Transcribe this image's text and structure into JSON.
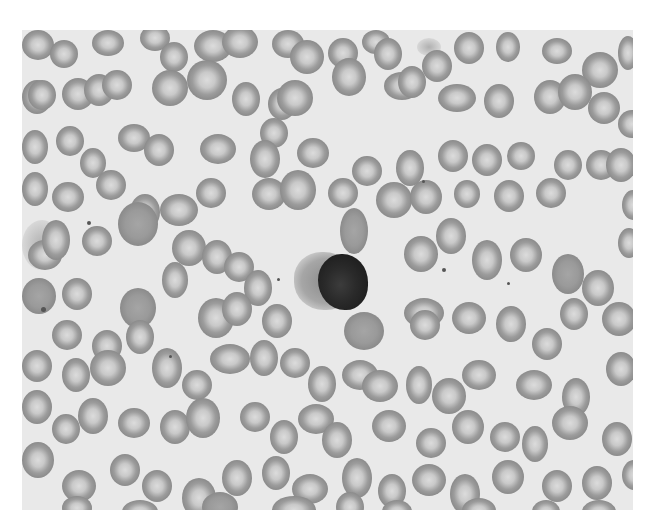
{
  "image": {
    "subject": "blood smear micrograph",
    "colors": {
      "background": "#ffffff",
      "field": "#e9e9e9",
      "rbc_rim": "#8a8a8a",
      "rbc_center": "#dcdcdc",
      "nucleus": "#222222"
    },
    "frame": {
      "x": 22,
      "y": 30,
      "w": 611,
      "h": 480
    },
    "lymphocyte": {
      "cytoplasm": {
        "x": 272,
        "y": 222,
        "w": 62,
        "h": 58
      },
      "nucleus": {
        "x": 296,
        "y": 224,
        "w": 50,
        "h": 56
      }
    },
    "platelets": [
      {
        "x": 400,
        "y": 150,
        "s": 3
      },
      {
        "x": 420,
        "y": 238,
        "s": 4
      },
      {
        "x": 485,
        "y": 252,
        "s": 3
      },
      {
        "x": 255,
        "y": 248,
        "s": 3
      },
      {
        "x": 65,
        "y": 191,
        "s": 4
      },
      {
        "x": 147,
        "y": 325,
        "s": 3
      },
      {
        "x": 19,
        "y": 277,
        "s": 5
      }
    ],
    "smudges": [
      {
        "x": 0,
        "y": 190,
        "w": 40,
        "h": 50
      },
      {
        "x": 395,
        "y": 8,
        "w": 24,
        "h": 18
      }
    ],
    "cells": [
      {
        "x": 0,
        "y": 0,
        "w": 32,
        "h": 30
      },
      {
        "x": 28,
        "y": 10,
        "w": 28,
        "h": 28
      },
      {
        "x": 70,
        "y": 0,
        "w": 32,
        "h": 26
      },
      {
        "x": 118,
        "y": -5,
        "w": 30,
        "h": 26
      },
      {
        "x": 138,
        "y": 12,
        "w": 28,
        "h": 30
      },
      {
        "x": 172,
        "y": 0,
        "w": 38,
        "h": 32
      },
      {
        "x": 200,
        "y": -4,
        "w": 36,
        "h": 32
      },
      {
        "x": 250,
        "y": 0,
        "w": 32,
        "h": 28
      },
      {
        "x": 268,
        "y": 10,
        "w": 34,
        "h": 34
      },
      {
        "x": 306,
        "y": 8,
        "w": 30,
        "h": 30
      },
      {
        "x": 340,
        "y": 0,
        "w": 28,
        "h": 24
      },
      {
        "x": 352,
        "y": 8,
        "w": 28,
        "h": 32
      },
      {
        "x": 400,
        "y": 20,
        "w": 30,
        "h": 32
      },
      {
        "x": 432,
        "y": 2,
        "w": 30,
        "h": 32
      },
      {
        "x": 474,
        "y": 2,
        "w": 24,
        "h": 30
      },
      {
        "x": 520,
        "y": 8,
        "w": 30,
        "h": 26
      },
      {
        "x": 560,
        "y": 22,
        "w": 36,
        "h": 36
      },
      {
        "x": 596,
        "y": 6,
        "w": 20,
        "h": 34
      },
      {
        "x": 0,
        "y": 50,
        "w": 30,
        "h": 34
      },
      {
        "x": 0,
        "y": 100,
        "w": 26,
        "h": 34
      },
      {
        "x": 6,
        "y": 50,
        "w": 28,
        "h": 30
      },
      {
        "x": 40,
        "y": 48,
        "w": 32,
        "h": 32
      },
      {
        "x": 62,
        "y": 44,
        "w": 30,
        "h": 32
      },
      {
        "x": 80,
        "y": 40,
        "w": 30,
        "h": 30
      },
      {
        "x": 130,
        "y": 40,
        "w": 36,
        "h": 36
      },
      {
        "x": 165,
        "y": 30,
        "w": 40,
        "h": 40
      },
      {
        "x": 210,
        "y": 52,
        "w": 28,
        "h": 34
      },
      {
        "x": 246,
        "y": 58,
        "w": 28,
        "h": 32
      },
      {
        "x": 255,
        "y": 50,
        "w": 36,
        "h": 36
      },
      {
        "x": 310,
        "y": 28,
        "w": 34,
        "h": 38
      },
      {
        "x": 362,
        "y": 42,
        "w": 36,
        "h": 28
      },
      {
        "x": 376,
        "y": 36,
        "w": 28,
        "h": 32
      },
      {
        "x": 416,
        "y": 54,
        "w": 38,
        "h": 28
      },
      {
        "x": 462,
        "y": 54,
        "w": 30,
        "h": 34
      },
      {
        "x": 512,
        "y": 50,
        "w": 32,
        "h": 34
      },
      {
        "x": 536,
        "y": 44,
        "w": 34,
        "h": 36
      },
      {
        "x": 566,
        "y": 62,
        "w": 32,
        "h": 32
      },
      {
        "x": 596,
        "y": 80,
        "w": 28,
        "h": 28
      },
      {
        "x": 34,
        "y": 96,
        "w": 28,
        "h": 30
      },
      {
        "x": 58,
        "y": 118,
        "w": 26,
        "h": 30
      },
      {
        "x": 96,
        "y": 94,
        "w": 32,
        "h": 28
      },
      {
        "x": 122,
        "y": 104,
        "w": 30,
        "h": 32
      },
      {
        "x": 178,
        "y": 104,
        "w": 36,
        "h": 30
      },
      {
        "x": 238,
        "y": 88,
        "w": 28,
        "h": 30
      },
      {
        "x": 228,
        "y": 110,
        "w": 30,
        "h": 38
      },
      {
        "x": 275,
        "y": 108,
        "w": 32,
        "h": 30
      },
      {
        "x": 330,
        "y": 126,
        "w": 30,
        "h": 30
      },
      {
        "x": 374,
        "y": 120,
        "w": 28,
        "h": 36
      },
      {
        "x": 416,
        "y": 110,
        "w": 30,
        "h": 32
      },
      {
        "x": 450,
        "y": 114,
        "w": 30,
        "h": 32
      },
      {
        "x": 485,
        "y": 112,
        "w": 28,
        "h": 28
      },
      {
        "x": 532,
        "y": 120,
        "w": 28,
        "h": 30
      },
      {
        "x": 564,
        "y": 120,
        "w": 30,
        "h": 30
      },
      {
        "x": 584,
        "y": 118,
        "w": 30,
        "h": 34
      },
      {
        "x": 0,
        "y": 142,
        "w": 26,
        "h": 34
      },
      {
        "x": 30,
        "y": 152,
        "w": 32,
        "h": 30
      },
      {
        "x": 74,
        "y": 140,
        "w": 30,
        "h": 30
      },
      {
        "x": 108,
        "y": 164,
        "w": 30,
        "h": 36
      },
      {
        "x": 174,
        "y": 148,
        "w": 30,
        "h": 30
      },
      {
        "x": 138,
        "y": 164,
        "w": 38,
        "h": 32
      },
      {
        "x": 230,
        "y": 148,
        "w": 34,
        "h": 32
      },
      {
        "x": 258,
        "y": 140,
        "w": 36,
        "h": 40
      },
      {
        "x": 306,
        "y": 148,
        "w": 30,
        "h": 30
      },
      {
        "x": 354,
        "y": 152,
        "w": 36,
        "h": 36
      },
      {
        "x": 388,
        "y": 150,
        "w": 32,
        "h": 34
      },
      {
        "x": 432,
        "y": 150,
        "w": 26,
        "h": 28
      },
      {
        "x": 472,
        "y": 150,
        "w": 30,
        "h": 32
      },
      {
        "x": 514,
        "y": 148,
        "w": 30,
        "h": 30
      },
      {
        "x": 600,
        "y": 160,
        "w": 22,
        "h": 30
      },
      {
        "x": 96,
        "y": 172,
        "w": 40,
        "h": 44,
        "dense": true
      },
      {
        "x": 6,
        "y": 210,
        "w": 34,
        "h": 30
      },
      {
        "x": 20,
        "y": 190,
        "w": 28,
        "h": 40
      },
      {
        "x": 60,
        "y": 196,
        "w": 30,
        "h": 30
      },
      {
        "x": 150,
        "y": 200,
        "w": 34,
        "h": 36
      },
      {
        "x": 140,
        "y": 232,
        "w": 26,
        "h": 36
      },
      {
        "x": 180,
        "y": 210,
        "w": 30,
        "h": 34
      },
      {
        "x": 202,
        "y": 222,
        "w": 30,
        "h": 30
      },
      {
        "x": 222,
        "y": 240,
        "w": 28,
        "h": 36
      },
      {
        "x": 318,
        "y": 178,
        "w": 28,
        "h": 46,
        "dense": true
      },
      {
        "x": 382,
        "y": 206,
        "w": 34,
        "h": 36
      },
      {
        "x": 414,
        "y": 188,
        "w": 30,
        "h": 36
      },
      {
        "x": 450,
        "y": 210,
        "w": 30,
        "h": 40
      },
      {
        "x": 488,
        "y": 208,
        "w": 32,
        "h": 34
      },
      {
        "x": 530,
        "y": 224,
        "w": 32,
        "h": 40,
        "dense": true
      },
      {
        "x": 560,
        "y": 240,
        "w": 32,
        "h": 36
      },
      {
        "x": 596,
        "y": 198,
        "w": 22,
        "h": 30
      },
      {
        "x": 0,
        "y": 248,
        "w": 34,
        "h": 36,
        "dense": true
      },
      {
        "x": 40,
        "y": 248,
        "w": 30,
        "h": 32
      },
      {
        "x": 98,
        "y": 258,
        "w": 36,
        "h": 40,
        "dense": true
      },
      {
        "x": 104,
        "y": 290,
        "w": 28,
        "h": 34
      },
      {
        "x": 70,
        "y": 300,
        "w": 30,
        "h": 32
      },
      {
        "x": 30,
        "y": 290,
        "w": 30,
        "h": 30
      },
      {
        "x": 176,
        "y": 268,
        "w": 36,
        "h": 40
      },
      {
        "x": 200,
        "y": 262,
        "w": 30,
        "h": 34
      },
      {
        "x": 240,
        "y": 274,
        "w": 30,
        "h": 34
      },
      {
        "x": 322,
        "y": 282,
        "w": 40,
        "h": 38,
        "dense": true
      },
      {
        "x": 382,
        "y": 268,
        "w": 40,
        "h": 30
      },
      {
        "x": 388,
        "y": 280,
        "w": 30,
        "h": 30
      },
      {
        "x": 430,
        "y": 272,
        "w": 34,
        "h": 32
      },
      {
        "x": 474,
        "y": 276,
        "w": 30,
        "h": 36
      },
      {
        "x": 510,
        "y": 298,
        "w": 30,
        "h": 32
      },
      {
        "x": 538,
        "y": 268,
        "w": 28,
        "h": 32
      },
      {
        "x": 580,
        "y": 272,
        "w": 34,
        "h": 34
      },
      {
        "x": 0,
        "y": 320,
        "w": 30,
        "h": 32
      },
      {
        "x": 40,
        "y": 328,
        "w": 28,
        "h": 34
      },
      {
        "x": 68,
        "y": 320,
        "w": 36,
        "h": 36
      },
      {
        "x": 130,
        "y": 318,
        "w": 30,
        "h": 40
      },
      {
        "x": 160,
        "y": 340,
        "w": 30,
        "h": 30
      },
      {
        "x": 188,
        "y": 314,
        "w": 40,
        "h": 30
      },
      {
        "x": 228,
        "y": 310,
        "w": 28,
        "h": 36
      },
      {
        "x": 258,
        "y": 318,
        "w": 30,
        "h": 30
      },
      {
        "x": 286,
        "y": 336,
        "w": 28,
        "h": 36
      },
      {
        "x": 320,
        "y": 330,
        "w": 36,
        "h": 30
      },
      {
        "x": 340,
        "y": 340,
        "w": 36,
        "h": 32
      },
      {
        "x": 384,
        "y": 336,
        "w": 26,
        "h": 38
      },
      {
        "x": 410,
        "y": 348,
        "w": 34,
        "h": 36
      },
      {
        "x": 440,
        "y": 330,
        "w": 34,
        "h": 30
      },
      {
        "x": 494,
        "y": 340,
        "w": 36,
        "h": 30
      },
      {
        "x": 540,
        "y": 348,
        "w": 28,
        "h": 38
      },
      {
        "x": 584,
        "y": 322,
        "w": 30,
        "h": 34
      },
      {
        "x": 0,
        "y": 360,
        "w": 30,
        "h": 34
      },
      {
        "x": 30,
        "y": 384,
        "w": 28,
        "h": 30
      },
      {
        "x": 56,
        "y": 368,
        "w": 30,
        "h": 36
      },
      {
        "x": 96,
        "y": 378,
        "w": 32,
        "h": 30
      },
      {
        "x": 138,
        "y": 380,
        "w": 30,
        "h": 34
      },
      {
        "x": 164,
        "y": 368,
        "w": 34,
        "h": 40
      },
      {
        "x": 218,
        "y": 372,
        "w": 30,
        "h": 30
      },
      {
        "x": 248,
        "y": 390,
        "w": 28,
        "h": 34
      },
      {
        "x": 276,
        "y": 374,
        "w": 36,
        "h": 30
      },
      {
        "x": 300,
        "y": 392,
        "w": 30,
        "h": 36
      },
      {
        "x": 350,
        "y": 380,
        "w": 34,
        "h": 32
      },
      {
        "x": 394,
        "y": 398,
        "w": 30,
        "h": 30
      },
      {
        "x": 430,
        "y": 380,
        "w": 32,
        "h": 34
      },
      {
        "x": 468,
        "y": 392,
        "w": 30,
        "h": 30
      },
      {
        "x": 500,
        "y": 396,
        "w": 26,
        "h": 36
      },
      {
        "x": 530,
        "y": 376,
        "w": 36,
        "h": 34
      },
      {
        "x": 580,
        "y": 392,
        "w": 30,
        "h": 34
      },
      {
        "x": 0,
        "y": 412,
        "w": 32,
        "h": 36
      },
      {
        "x": 40,
        "y": 440,
        "w": 34,
        "h": 32
      },
      {
        "x": 88,
        "y": 424,
        "w": 30,
        "h": 32
      },
      {
        "x": 120,
        "y": 440,
        "w": 30,
        "h": 32
      },
      {
        "x": 160,
        "y": 448,
        "w": 34,
        "h": 40
      },
      {
        "x": 200,
        "y": 430,
        "w": 30,
        "h": 36
      },
      {
        "x": 240,
        "y": 426,
        "w": 28,
        "h": 34
      },
      {
        "x": 270,
        "y": 444,
        "w": 36,
        "h": 30
      },
      {
        "x": 320,
        "y": 428,
        "w": 30,
        "h": 40
      },
      {
        "x": 356,
        "y": 444,
        "w": 28,
        "h": 34
      },
      {
        "x": 390,
        "y": 434,
        "w": 34,
        "h": 32
      },
      {
        "x": 428,
        "y": 444,
        "w": 30,
        "h": 40
      },
      {
        "x": 470,
        "y": 430,
        "w": 32,
        "h": 34
      },
      {
        "x": 520,
        "y": 440,
        "w": 30,
        "h": 32
      },
      {
        "x": 560,
        "y": 436,
        "w": 30,
        "h": 34
      },
      {
        "x": 600,
        "y": 430,
        "w": 24,
        "h": 30
      },
      {
        "x": 40,
        "y": 466,
        "w": 30,
        "h": 24
      },
      {
        "x": 100,
        "y": 470,
        "w": 36,
        "h": 24
      },
      {
        "x": 180,
        "y": 462,
        "w": 36,
        "h": 30,
        "dense": true
      },
      {
        "x": 250,
        "y": 466,
        "w": 44,
        "h": 28
      },
      {
        "x": 314,
        "y": 462,
        "w": 28,
        "h": 30
      },
      {
        "x": 360,
        "y": 470,
        "w": 30,
        "h": 24
      },
      {
        "x": 440,
        "y": 468,
        "w": 34,
        "h": 26
      },
      {
        "x": 510,
        "y": 470,
        "w": 28,
        "h": 24
      },
      {
        "x": 560,
        "y": 470,
        "w": 34,
        "h": 24
      }
    ]
  }
}
